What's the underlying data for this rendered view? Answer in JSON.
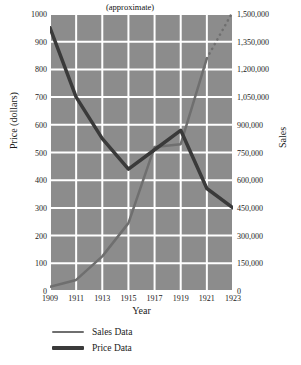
{
  "chart_data": {
    "type": "line",
    "title": "",
    "xlabel": "Year",
    "ylabel": "Price (dollars)",
    "ylabel_secondary": "Sales",
    "x": [
      1909,
      1911,
      1913,
      1915,
      1917,
      1919,
      1921,
      1923
    ],
    "xticklabels": [
      "1909",
      "1911",
      "1913",
      "1915",
      "1917",
      "1919",
      "1921",
      "1923"
    ],
    "xlim": [
      1909,
      1923
    ],
    "ylim": [
      0,
      1000
    ],
    "yticks": [
      0,
      100,
      200,
      300,
      400,
      500,
      600,
      700,
      800,
      900,
      1000
    ],
    "yticklabels": [
      "0",
      "100",
      "200",
      "300",
      "400",
      "500",
      "600",
      "700",
      "800",
      "900",
      "1000"
    ],
    "ylim_secondary": [
      0,
      1500000
    ],
    "yticks_secondary": [
      0,
      150000,
      300000,
      450000,
      600000,
      750000,
      900000,
      1050000,
      1200000,
      1350000,
      1500000
    ],
    "yticklabels_secondary": [
      "0",
      "150,000",
      "300,000",
      "450,000",
      "600,000",
      "750,000",
      "900,000",
      "1,050,000",
      "1,200,000",
      "1,350,000",
      "1,500,000"
    ],
    "grid": true,
    "grid_color": "#ffffff",
    "plot_background": "#8c8c8c",
    "legend_position": "below",
    "annotations": [
      {
        "text": "(approximate)",
        "x": 1917.5,
        "y": 985,
        "note": "marks the dotted projected portion of the Sales Data series"
      }
    ],
    "series": [
      {
        "name": "Sales Data",
        "axis": "secondary",
        "color": "#6f6f6f",
        "linewidth": 2.5,
        "values": [
          22500,
          60000,
          187500,
          367500,
          780000,
          795000,
          1260000,
          1515000
        ],
        "values_on_price_scale": [
          15,
          40,
          125,
          245,
          520,
          530,
          840,
          1010
        ],
        "dashed_segment": {
          "from": 1921,
          "to": 1923,
          "style": "dotted",
          "label": "(approximate)"
        }
      },
      {
        "name": "Price Data",
        "axis": "primary",
        "color": "#3a3a3a",
        "linewidth": 3.5,
        "values": [
          950,
          700,
          550,
          440,
          510,
          580,
          370,
          300
        ]
      }
    ]
  },
  "axes": {
    "left_title": "Price (dollars)",
    "right_title": "Sales",
    "bottom_title": "Year"
  },
  "annotation": {
    "approximate": "(approximate)"
  },
  "legend": {
    "items": [
      {
        "label": "Sales Data",
        "color": "#6f6f6f"
      },
      {
        "label": "Price Data",
        "color": "#3a3a3a"
      }
    ]
  }
}
